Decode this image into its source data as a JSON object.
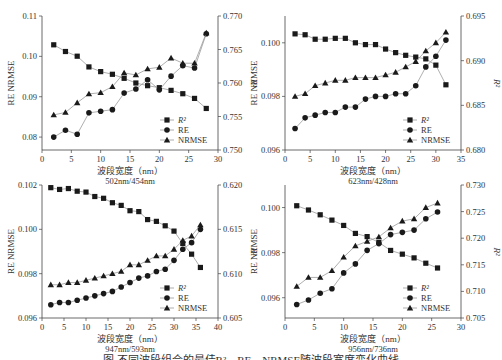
{
  "figure": {
    "caption": "图  不同波段组合的最佳R²、RE、NRMSE随波段宽度变化曲线"
  },
  "chart_data": [
    {
      "type": "line",
      "id": "p1",
      "subtitle": "502nm/454nm",
      "xlabel": "波段宽度（nm）",
      "ylabel": "RE  NRMSE",
      "y2label": "R²",
      "xlim": [
        0,
        30
      ],
      "xticks": [
        0,
        5,
        10,
        15,
        20,
        25,
        30
      ],
      "ylim": [
        0.0768,
        0.11
      ],
      "yticks": [
        0.08,
        0.09,
        0.1,
        0.11
      ],
      "ytick_labels": [
        "0.08",
        "0.09",
        "0.10",
        "0.11"
      ],
      "y2lim": [
        0.75,
        0.77
      ],
      "y2ticks": [
        0.75,
        0.755,
        0.76,
        0.765,
        0.77
      ],
      "y2tick_labels": [
        "0.750",
        "0.755",
        "0.760",
        "0.765",
        "0.770"
      ],
      "grid": false,
      "legend_position": "lower right",
      "x": [
        2,
        4,
        6,
        8,
        10,
        12,
        14,
        16,
        18,
        20,
        22,
        24,
        26,
        28
      ],
      "series": [
        {
          "name": "R²",
          "axis": "right",
          "marker": "square",
          "values": [
            0.7657,
            0.7647,
            0.764,
            0.7624,
            0.7617,
            0.7613,
            0.7607,
            0.76,
            0.7596,
            0.7593,
            0.7589,
            0.7584,
            0.7577,
            0.7562
          ]
        },
        {
          "name": "RE",
          "axis": "left",
          "marker": "circle",
          "values": [
            0.08,
            0.0817,
            0.0807,
            0.086,
            0.0864,
            0.0868,
            0.0909,
            0.0919,
            0.0942,
            0.0917,
            0.0951,
            0.0977,
            0.0971,
            0.1056
          ]
        },
        {
          "name": "NRMSE",
          "axis": "left",
          "marker": "triangle",
          "values": [
            0.0855,
            0.0861,
            0.0885,
            0.0907,
            0.091,
            0.0925,
            0.0959,
            0.0954,
            0.0969,
            0.0973,
            0.0996,
            0.0983,
            0.0983,
            0.1058
          ]
        }
      ]
    },
    {
      "type": "line",
      "id": "p2",
      "subtitle": "623nm/428nm",
      "xlabel": "波段宽度（nm）",
      "ylabel": "RE  NRMSE",
      "y2label": "R²",
      "xlim": [
        0,
        35
      ],
      "xticks": [
        0,
        5,
        10,
        15,
        20,
        25,
        30,
        35
      ],
      "ylim": [
        0.096,
        0.101
      ],
      "yticks": [
        0.096,
        0.098,
        0.1
      ],
      "ytick_labels": [
        "0.096",
        "0.098",
        "0.100"
      ],
      "y2lim": [
        0.68,
        0.695
      ],
      "y2ticks": [
        0.68,
        0.685,
        0.69,
        0.695
      ],
      "y2tick_labels": [
        "0.680",
        "0.685",
        "0.690",
        "0.695"
      ],
      "grid": false,
      "legend_position": "lower right",
      "x": [
        2,
        4,
        6,
        8,
        10,
        12,
        14,
        16,
        18,
        20,
        22,
        24,
        26,
        28,
        30,
        32
      ],
      "series": [
        {
          "name": "R²",
          "axis": "right",
          "marker": "square",
          "values": [
            0.693,
            0.6929,
            0.6924,
            0.6924,
            0.6925,
            0.6925,
            0.692,
            0.6918,
            0.6918,
            0.6913,
            0.6909,
            0.6906,
            0.6904,
            0.6902,
            0.6895,
            0.6873
          ]
        },
        {
          "name": "RE",
          "axis": "left",
          "marker": "circle",
          "values": [
            0.0968,
            0.0972,
            0.0973,
            0.0974,
            0.0974,
            0.0976,
            0.0976,
            0.0979,
            0.098,
            0.098,
            0.0981,
            0.0981,
            0.0984,
            0.0991,
            0.0995,
            0.1001
          ]
        },
        {
          "name": "NRMSE",
          "axis": "left",
          "marker": "triangle",
          "values": [
            0.098,
            0.0981,
            0.0984,
            0.0985,
            0.0986,
            0.0986,
            0.0987,
            0.0987,
            0.0987,
            0.0988,
            0.0989,
            0.0991,
            0.0993,
            0.0997,
            0.1,
            0.1004
          ]
        }
      ]
    },
    {
      "type": "line",
      "id": "p3",
      "subtitle": "947nm/593nm",
      "xlabel": "波段宽度（nm）",
      "ylabel": "RE  NRMSE",
      "y2label": "R²",
      "xlim": [
        0,
        40
      ],
      "xticks": [
        0,
        5,
        10,
        15,
        20,
        25,
        30,
        35,
        40
      ],
      "ylim": [
        0.096,
        0.102
      ],
      "yticks": [
        0.096,
        0.098,
        0.1,
        0.102
      ],
      "ytick_labels": [
        "0.096",
        "0.098",
        "0.100",
        "0.102"
      ],
      "y2lim": [
        0.605,
        0.62
      ],
      "y2ticks": [
        0.605,
        0.61,
        0.615,
        0.62
      ],
      "y2tick_labels": [
        "0.605",
        "0.610",
        "0.615",
        "0.620"
      ],
      "grid": false,
      "legend_position": "lower right",
      "x": [
        2,
        4,
        6,
        8,
        10,
        12,
        14,
        16,
        18,
        20,
        22,
        24,
        26,
        28,
        30,
        32,
        34,
        36
      ],
      "series": [
        {
          "name": "R²",
          "axis": "right",
          "marker": "square",
          "values": [
            0.6197,
            0.6195,
            0.6196,
            0.6193,
            0.6192,
            0.6187,
            0.6185,
            0.618,
            0.6177,
            0.6171,
            0.617,
            0.6161,
            0.6159,
            0.6154,
            0.6148,
            0.6134,
            0.6122,
            0.6107
          ]
        },
        {
          "name": "RE",
          "axis": "left",
          "marker": "circle",
          "values": [
            0.0966,
            0.0967,
            0.0967,
            0.0968,
            0.0969,
            0.097,
            0.0971,
            0.0972,
            0.0974,
            0.0976,
            0.0978,
            0.0979,
            0.0981,
            0.0982,
            0.0986,
            0.0991,
            0.0994,
            0.1
          ]
        },
        {
          "name": "NRMSE",
          "axis": "left",
          "marker": "triangle",
          "values": [
            0.0975,
            0.0975,
            0.0976,
            0.0976,
            0.0977,
            0.0978,
            0.0979,
            0.098,
            0.0981,
            0.0984,
            0.0984,
            0.0986,
            0.0988,
            0.0988,
            0.0991,
            0.0995,
            0.0997,
            0.1002
          ]
        }
      ]
    },
    {
      "type": "line",
      "id": "p4",
      "subtitle": "956nm/736nm",
      "xlabel": "波段宽度（nm）",
      "ylabel": "RE  NRMSE",
      "y2label": "R²",
      "xlim": [
        0,
        30
      ],
      "xticks": [
        0,
        5,
        10,
        15,
        20,
        25,
        30
      ],
      "ylim": [
        0.0951,
        0.101
      ],
      "yticks": [
        0.096,
        0.098,
        0.1
      ],
      "ytick_labels": [
        "0.096",
        "0.098",
        "0.100"
      ],
      "y2lim": [
        0.705,
        0.73
      ],
      "y2ticks": [
        0.705,
        0.71,
        0.715,
        0.72,
        0.725,
        0.73
      ],
      "y2tick_labels": [
        "0.705",
        "0.710",
        "0.715",
        "0.720",
        "0.725",
        "0.730"
      ],
      "grid": false,
      "legend_position": "lower right",
      "x": [
        2,
        4,
        6,
        8,
        10,
        12,
        14,
        16,
        18,
        20,
        22,
        24,
        26
      ],
      "series": [
        {
          "name": "R²",
          "axis": "right",
          "marker": "square",
          "values": [
            0.7261,
            0.7253,
            0.7244,
            0.7234,
            0.7224,
            0.7209,
            0.7203,
            0.7192,
            0.7177,
            0.717,
            0.7163,
            0.7153,
            0.7144
          ]
        },
        {
          "name": "RE",
          "axis": "left",
          "marker": "circle",
          "values": [
            0.0957,
            0.0959,
            0.0962,
            0.0964,
            0.0971,
            0.0975,
            0.0981,
            0.0984,
            0.0988,
            0.0989,
            0.099,
            0.0995,
            0.0998
          ]
        },
        {
          "name": "NRMSE",
          "axis": "left",
          "marker": "triangle",
          "values": [
            0.0965,
            0.0969,
            0.0969,
            0.0972,
            0.0978,
            0.0983,
            0.0985,
            0.0987,
            0.0991,
            0.0994,
            0.0995,
            0.1,
            0.1002
          ]
        }
      ]
    }
  ],
  "style": {
    "axis_color": "#444444",
    "line_color": "#9a9a9a",
    "marker_color": "#1a1a1a",
    "text_color": "#333333"
  }
}
